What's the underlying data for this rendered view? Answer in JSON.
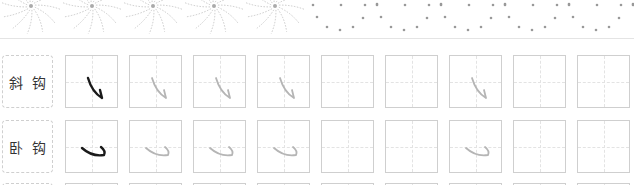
{
  "header": {
    "decoration": "sunburst-and-dots-border"
  },
  "rows": [
    {
      "label": [
        "斜",
        "钩"
      ],
      "stroke": "xiegou",
      "cells": [
        "solid",
        "trace",
        "trace",
        "trace",
        "empty",
        "empty",
        "trace",
        "empty",
        "empty"
      ]
    },
    {
      "label": [
        "卧",
        "钩"
      ],
      "stroke": "wogou",
      "cells": [
        "solid",
        "trace",
        "trace",
        "trace",
        "empty",
        "empty",
        "trace",
        "empty",
        "empty"
      ]
    }
  ],
  "colors": {
    "solid_stroke": "#1a1a1a",
    "trace_stroke": "#b5b5b5",
    "grid_border": "#cfcfcf",
    "grid_guide": "#e3e3e3"
  }
}
